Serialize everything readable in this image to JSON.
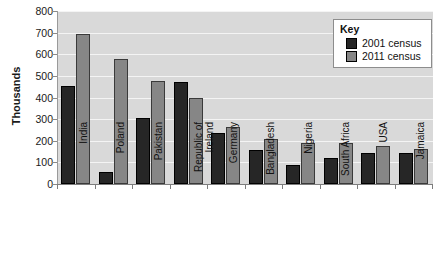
{
  "chart_data": {
    "type": "bar",
    "title": "",
    "xlabel": "",
    "ylabel": "Thousands",
    "ylim": [
      0,
      800
    ],
    "ytick_step": 100,
    "yticks": [
      "800",
      "700",
      "600",
      "500",
      "400",
      "300",
      "200",
      "100",
      "0"
    ],
    "grid": true,
    "legend_position": "top-right",
    "legend_title": "Key",
    "categories": [
      "India",
      "Poland",
      "Pakistan",
      "Republic of\nIreland",
      "Germany",
      "Bangladesh",
      "Nigeria",
      "South Africa",
      "USA",
      "Jamaica"
    ],
    "series": [
      {
        "name": "2001 census",
        "color": "#262626",
        "values": [
          455,
          55,
          305,
          470,
          238,
          155,
          88,
          120,
          145,
          145
        ]
      },
      {
        "name": "2011 census",
        "color": "#868686",
        "values": [
          695,
          578,
          478,
          400,
          265,
          208,
          190,
          190,
          175,
          160
        ]
      }
    ]
  },
  "colors": {
    "plot_background": "#d9d9d9",
    "gridline": "#f4f4f4",
    "axis": "#7d7d7d",
    "page_background": "#ffffff",
    "text": "#111111"
  }
}
